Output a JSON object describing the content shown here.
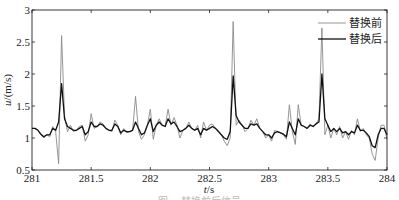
{
  "chart_data": {
    "type": "line",
    "title": "",
    "xlabel": "t/s",
    "ylabel": "u/(m/s)",
    "xlim": [
      281,
      284
    ],
    "ylim": [
      0.5,
      3
    ],
    "xticks": [
      281,
      281.5,
      282,
      282.5,
      283,
      283.5,
      284
    ],
    "xtick_labels": [
      "281",
      "281.5",
      "282",
      "282.5",
      "283",
      "283.5",
      "284"
    ],
    "yticks": [
      0.5,
      1,
      1.5,
      2,
      2.5,
      3
    ],
    "ytick_labels": [
      "0.5",
      "1",
      "1.5",
      "2",
      "2.5",
      "3"
    ],
    "grid": false,
    "legend_position": "upper right",
    "x_start": 281,
    "x_step": 0.025,
    "series": [
      {
        "name": "替换前",
        "color": "#8a8a8a",
        "width": 0.9,
        "values": [
          1.15,
          1.15,
          1.12,
          1.05,
          1.0,
          1.05,
          1.02,
          1.18,
          1.1,
          0.6,
          2.6,
          1.35,
          1.1,
          1.2,
          1.1,
          1.12,
          1.18,
          1.2,
          0.95,
          1.05,
          1.38,
          1.15,
          1.18,
          1.25,
          1.22,
          1.15,
          1.12,
          1.1,
          1.28,
          1.2,
          1.05,
          1.15,
          1.08,
          1.1,
          1.12,
          1.65,
          1.1,
          0.98,
          1.05,
          1.2,
          1.45,
          0.98,
          1.2,
          1.3,
          1.2,
          1.18,
          1.45,
          1.2,
          1.32,
          1.2,
          1.0,
          1.12,
          1.15,
          1.25,
          1.15,
          1.12,
          1.2,
          1.0,
          1.25,
          1.12,
          1.2,
          1.22,
          1.15,
          1.12,
          1.05,
          0.95,
          0.88,
          1.0,
          2.82,
          1.2,
          1.28,
          1.2,
          1.1,
          1.15,
          1.28,
          1.2,
          1.3,
          1.15,
          1.1,
          1.0,
          1.05,
          0.95,
          1.12,
          1.1,
          1.08,
          1.05,
          0.98,
          1.52,
          1.1,
          0.9,
          1.52,
          1.2,
          1.18,
          1.15,
          1.22,
          1.18,
          1.22,
          1.3,
          2.72,
          1.05,
          1.2,
          1.0,
          1.15,
          1.05,
          1.18,
          1.0,
          1.1,
          0.98,
          1.12,
          1.05,
          1.3,
          1.1,
          1.15,
          1.05,
          1.0,
          0.75,
          0.65,
          1.0,
          1.2,
          1.2,
          0.98
        ]
      },
      {
        "name": "替换后",
        "color": "#111111",
        "width": 1.3,
        "values": [
          1.15,
          1.15,
          1.12,
          1.06,
          1.02,
          1.05,
          1.05,
          1.15,
          1.12,
          1.25,
          1.85,
          1.3,
          1.18,
          1.15,
          1.12,
          1.12,
          1.15,
          1.18,
          1.05,
          1.1,
          1.25,
          1.18,
          1.18,
          1.22,
          1.2,
          1.15,
          1.12,
          1.12,
          1.22,
          1.18,
          1.08,
          1.12,
          1.1,
          1.1,
          1.12,
          1.25,
          1.15,
          1.05,
          1.08,
          1.2,
          1.3,
          1.1,
          1.2,
          1.25,
          1.2,
          1.18,
          1.3,
          1.22,
          1.25,
          1.18,
          1.1,
          1.12,
          1.15,
          1.2,
          1.15,
          1.12,
          1.15,
          1.05,
          1.15,
          1.12,
          1.15,
          1.18,
          1.15,
          1.1,
          1.05,
          1.0,
          0.98,
          1.1,
          1.97,
          1.35,
          1.25,
          1.2,
          1.15,
          1.15,
          1.22,
          1.2,
          1.22,
          1.15,
          1.1,
          1.05,
          1.05,
          1.0,
          1.08,
          1.1,
          1.08,
          1.06,
          1.02,
          1.25,
          1.15,
          1.05,
          1.3,
          1.2,
          1.18,
          1.15,
          1.2,
          1.18,
          1.22,
          1.25,
          2.0,
          1.3,
          1.2,
          1.1,
          1.15,
          1.1,
          1.15,
          1.08,
          1.1,
          1.05,
          1.1,
          1.08,
          1.2,
          1.12,
          1.12,
          1.08,
          1.02,
          0.88,
          0.85,
          1.05,
          1.15,
          1.15,
          1.05
        ]
      }
    ]
  },
  "legend": {
    "items": [
      "替换前",
      "替换后"
    ]
  },
  "axes": {
    "xlabel_italic": "t",
    "xlabel_unit": "/s",
    "ylabel_italic": "u",
    "ylabel_unit": "/(m/s)"
  },
  "caption": "图 ... 替换前后信号"
}
